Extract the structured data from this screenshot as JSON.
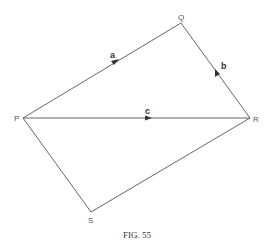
{
  "figure": {
    "caption": "Fig. 55",
    "caption_display": "FIG. 55",
    "vertices": {
      "P": {
        "label": "P",
        "x": 23,
        "y": 118
      },
      "Q": {
        "label": "Q",
        "x": 181,
        "y": 23
      },
      "R": {
        "label": "R",
        "x": 250,
        "y": 118
      },
      "S": {
        "label": "S",
        "x": 91,
        "y": 212
      }
    },
    "vectors": [
      {
        "name": "a",
        "label": "a",
        "from": "P",
        "to": "Q",
        "arrow_direction": "P-to-Q"
      },
      {
        "name": "b",
        "label": "b",
        "from": "R",
        "to": "Q",
        "arrow_direction": "R-to-Q"
      },
      {
        "name": "c",
        "label": "c",
        "from": "P",
        "to": "R",
        "arrow_direction": "P-to-R"
      }
    ],
    "edges": [
      {
        "from": "P",
        "to": "Q"
      },
      {
        "from": "Q",
        "to": "R"
      },
      {
        "from": "R",
        "to": "S"
      },
      {
        "from": "S",
        "to": "P"
      },
      {
        "from": "P",
        "to": "R"
      }
    ],
    "colors": {
      "line": "#555555",
      "text": "#333333",
      "background": "#ffffff"
    }
  }
}
